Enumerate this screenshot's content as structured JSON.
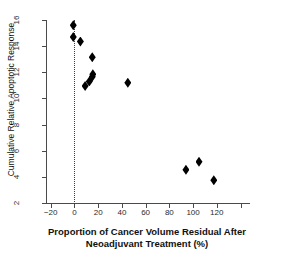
{
  "chart_data": {
    "type": "scatter",
    "title": "",
    "xlabel": "Proportion of Cancer Volume Residual After Neoadjuvant Treatment (%)",
    "xlabel_line1": "Proportion of Cancer Volume Residual After",
    "xlabel_line2": "Neoadjuvant Treatment (%)",
    "ylabel": "Cumulative Relative Apoptotic Response",
    "xlim": [
      -24,
      148
    ],
    "ylim": [
      2,
      16
    ],
    "xticks": [
      -20,
      0,
      20,
      40,
      60,
      80,
      100,
      120,
      140
    ],
    "xticklabels": [
      "−20",
      "0",
      "20",
      "40",
      "60",
      "80",
      "100",
      "120",
      ""
    ],
    "yticks": [
      2,
      4,
      6,
      8,
      10,
      12,
      14,
      16
    ],
    "yticklabels": [
      "2",
      "4",
      "6",
      "8",
      "10",
      "12",
      "14",
      "16"
    ],
    "grid": false,
    "legend": null,
    "marker": "filled-diamond",
    "marker_color": "#000000",
    "annotations": [
      {
        "name": "zero-reference-line",
        "type": "vline",
        "x": 0,
        "style": "dotted",
        "color": "#3c3c3c"
      }
    ],
    "points": [
      {
        "x": -1.0,
        "y": 15.6
      },
      {
        "x": -1.0,
        "y": 14.7
      },
      {
        "x": 5.0,
        "y": 14.35
      },
      {
        "x": 15.0,
        "y": 13.15
      },
      {
        "x": 9.0,
        "y": 10.95
      },
      {
        "x": 12.5,
        "y": 11.3
      },
      {
        "x": 15.0,
        "y": 11.65
      },
      {
        "x": 15.5,
        "y": 11.85
      },
      {
        "x": 45.0,
        "y": 11.2
      },
      {
        "x": 94.0,
        "y": 4.55
      },
      {
        "x": 105.0,
        "y": 5.15
      },
      {
        "x": 117.5,
        "y": 3.75
      }
    ]
  }
}
